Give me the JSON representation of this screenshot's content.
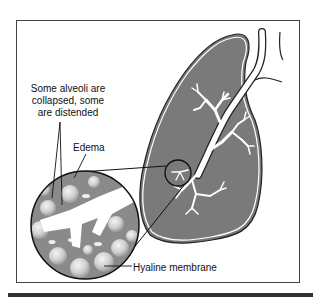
{
  "figure": {
    "labels": {
      "alveoli": "Some alveoli are collapsed, some are distended",
      "alveoli_lines": [
        "Some alveoli are",
        "collapsed, some",
        "are distended"
      ],
      "edema": "Edema",
      "hyaline": "Hyaline membrane"
    },
    "colors": {
      "lung_fill": "#7a7a7a",
      "outline": "#222222",
      "airway": "#ffffff",
      "inset_bg": "#8a8a8a",
      "alveolus": "#d6d6d6",
      "bottom_bar": "#333333"
    }
  }
}
